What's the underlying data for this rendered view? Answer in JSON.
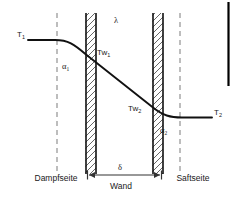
{
  "diagram": {
    "colors": {
      "curve": "#111111",
      "wall_outline": "#111111",
      "hatch": "#555555",
      "dashed_guide": "#9a9a9a",
      "dimension_arrow": "#333333",
      "text": "#1a1a1a",
      "edge_bar": "#000000",
      "background": "#ffffff"
    },
    "labels": {
      "t1": "T",
      "t1_sub": "1",
      "t2": "T",
      "t2_sub": "2",
      "tw1": "Tw",
      "tw1_sub": "1",
      "tw2": "Tw",
      "tw2_sub": "2",
      "alpha1": "α",
      "alpha1_sub": "1",
      "alpha2": "α",
      "alpha2_sub": "2",
      "lambda": "λ",
      "delta": "δ",
      "wand": "Wand",
      "dampfseite": "Dampfseite",
      "saftseite": "Saftseite"
    },
    "geometry": {
      "dashed_left_x": 57,
      "dashed_right_x": 180,
      "wall_left_outer_x": 85,
      "wall_left_inner_x": 96,
      "wall_right_inner_x": 152,
      "wall_right_outer_x": 163,
      "wall_top_y": 13,
      "wall_bottom_y": 174,
      "t1_level_y": 40,
      "t2_level_y": 117,
      "tw1_y": 55,
      "tw2_y": 108,
      "dimension_line_y": 175,
      "edge_bar_x": 228,
      "edge_bar_top_y": 2,
      "edge_bar_bottom_y": 86
    }
  }
}
